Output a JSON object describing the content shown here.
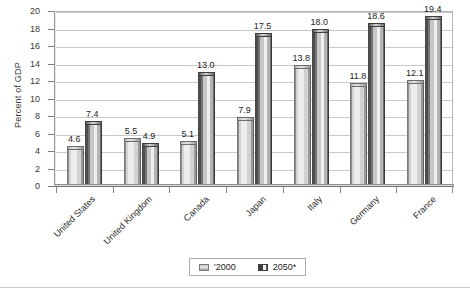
{
  "chart_data": {
    "type": "bar",
    "title": "",
    "xlabel": "",
    "ylabel": "Percent of GDP",
    "ylim": [
      0,
      20
    ],
    "ytick_step": 2,
    "yticks": [
      20,
      18,
      16,
      14,
      12,
      10,
      8,
      6,
      4,
      2,
      0
    ],
    "grid": true,
    "legend_position": "bottom",
    "categories": [
      "United States",
      "United Kingdom",
      "Canada",
      "Japan",
      "Italy",
      "Germany",
      "France"
    ],
    "series": [
      {
        "name": "'2000",
        "values": [
          4.6,
          5.5,
          5.1,
          7.9,
          13.8,
          11.8,
          12.1
        ],
        "labels": [
          "4.6",
          "5.5",
          "5.1",
          "7.9",
          "13.8",
          "11.8",
          "12.1"
        ],
        "color": "#e0e0e0"
      },
      {
        "name": "2050*",
        "values": [
          7.4,
          4.9,
          13.0,
          17.5,
          18.0,
          18.6,
          19.4
        ],
        "labels": [
          "7.4",
          "4.9",
          "13.0",
          "17.5",
          "18.0",
          "18.6",
          "19.4"
        ],
        "color": "#5a5a5a"
      }
    ]
  },
  "axis": {
    "y_title": "Percent of GDP"
  },
  "legend": {
    "entries": [
      {
        "label": "'2000"
      },
      {
        "label": "2050*"
      }
    ]
  }
}
